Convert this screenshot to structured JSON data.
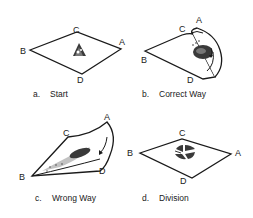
{
  "figure": {
    "panels": [
      {
        "id": "a",
        "caption_letter": "a.",
        "caption_text": "Start",
        "vertices": {
          "A": "A",
          "B": "B",
          "C": "C",
          "D": "D"
        }
      },
      {
        "id": "b",
        "caption_letter": "b.",
        "caption_text": "Correct Way",
        "vertices": {
          "A": "A",
          "B": "B",
          "C": "C",
          "D": "D"
        }
      },
      {
        "id": "c",
        "caption_letter": "c.",
        "caption_text": "Wrong Way",
        "vertices": {
          "A": "A",
          "B": "B",
          "C": "C",
          "D": "D"
        }
      },
      {
        "id": "d",
        "caption_letter": "d.",
        "caption_text": "Division",
        "vertices": {
          "A": "A",
          "B": "B",
          "C": "C",
          "D": "D"
        }
      }
    ],
    "colors": {
      "line": "#1a1a1a",
      "fill": "#ffffff",
      "shade": "#333333"
    }
  }
}
